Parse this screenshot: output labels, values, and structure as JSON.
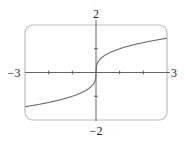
{
  "chart_data": {
    "type": "line",
    "title": "",
    "xlabel": "",
    "ylabel": "",
    "function": "y = x^(1/3)",
    "xlim": [
      -3,
      3
    ],
    "ylim": [
      -2,
      2
    ],
    "grid": false,
    "legend": null,
    "x_tick_labels": [
      "-3",
      "3"
    ],
    "y_tick_labels": [
      "2",
      "-2"
    ],
    "x_ticks": [
      -2,
      -1,
      1,
      2
    ],
    "y_ticks": [
      -1,
      1
    ],
    "series": [
      {
        "name": "curve",
        "x": [
          -3,
          -2.5,
          -2,
          -1.5,
          -1,
          -0.5,
          -0.25,
          -0.1,
          -0.02,
          0,
          0.02,
          0.1,
          0.25,
          0.5,
          1,
          1.5,
          2,
          2.5,
          3
        ],
        "values": [
          -1.442,
          -1.357,
          -1.26,
          -1.145,
          -1,
          -0.794,
          -0.63,
          -0.464,
          -0.271,
          0,
          0.271,
          0.464,
          0.63,
          0.794,
          1,
          1.145,
          1.26,
          1.357,
          1.442
        ]
      }
    ]
  },
  "labels": {
    "x_min": "−3",
    "x_max": "3",
    "y_max": "2",
    "y_min": "−2"
  },
  "colors": {
    "frame": "#bdbdbd",
    "axis": "#555555",
    "curve": "#6a6a6a"
  }
}
